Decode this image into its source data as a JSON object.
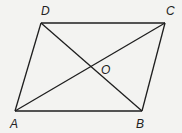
{
  "diagram": {
    "type": "parallelogram-with-diagonals",
    "background": "#f3f3f1",
    "line_color": "#1e1e1e",
    "vertices": {
      "A": {
        "label": "A",
        "x": 15,
        "y": 111
      },
      "B": {
        "label": "B",
        "x": 142,
        "y": 111
      },
      "C": {
        "label": "C",
        "x": 165,
        "y": 23
      },
      "D": {
        "label": "D",
        "x": 41,
        "y": 23
      }
    },
    "intersection": {
      "label": "O",
      "x": 91,
      "y": 67
    },
    "edges": [
      {
        "from": "A",
        "to": "B"
      },
      {
        "from": "B",
        "to": "C"
      },
      {
        "from": "C",
        "to": "D"
      },
      {
        "from": "D",
        "to": "A"
      }
    ],
    "diagonals": [
      {
        "from": "A",
        "to": "C"
      },
      {
        "from": "B",
        "to": "D"
      }
    ],
    "labels": {
      "A": "A",
      "B": "B",
      "C": "C",
      "D": "D",
      "O": "O"
    }
  }
}
